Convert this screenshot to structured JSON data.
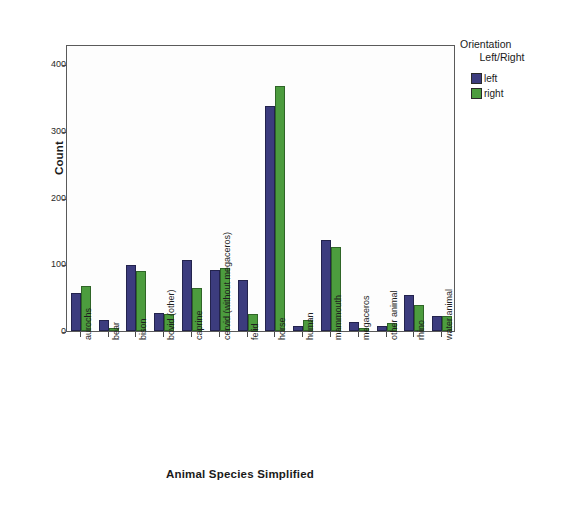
{
  "chart_data": {
    "type": "bar",
    "title": "",
    "xlabel": "Animal Species Simplified",
    "ylabel": "Count",
    "ylim": [
      0,
      430
    ],
    "yticks": [
      0,
      100,
      200,
      300,
      400
    ],
    "ytick_labels": [
      "0",
      "100",
      "200",
      "300",
      "400"
    ],
    "grid": false,
    "legend_position": "right",
    "legend_title_line1": "Orientation",
    "legend_title_line2": "Left/Right",
    "categories": [
      "aurochs",
      "bear",
      "bison",
      "bovid (other)",
      "caprine",
      "cervid (without megaceros)",
      "felid",
      "horse",
      "human",
      "mammouth",
      "megaceros",
      "other animal",
      "rhino",
      "water animal"
    ],
    "series": [
      {
        "name": "left",
        "color": "#3c3c7e",
        "values": [
          57,
          16,
          99,
          27,
          107,
          92,
          76,
          337,
          8,
          137,
          13,
          8,
          54,
          22
        ]
      },
      {
        "name": "right",
        "color": "#4c9c3e",
        "values": [
          68,
          4,
          90,
          25,
          64,
          95,
          26,
          367,
          17,
          126,
          4,
          12,
          39,
          22
        ]
      }
    ]
  }
}
